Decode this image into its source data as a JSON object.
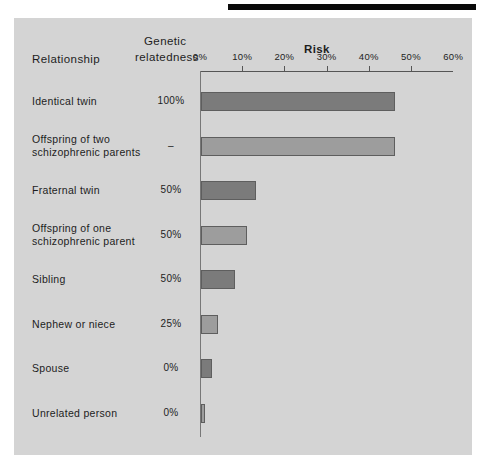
{
  "figure": {
    "headers": {
      "relationship": "Relationship",
      "genetic_line1": "Genetic",
      "genetic_line2": "relatedness",
      "risk": "Risk"
    }
  },
  "colors": {
    "panel_background": "#d4d4d4",
    "bar_dark": "#7b7b7b",
    "bar_light": "#9d9d9d",
    "bar_border": "#5e5e5e",
    "axis": "#555555",
    "text": "#1d1d1d",
    "top_rule": "#0a0a0a"
  },
  "chart_data": {
    "type": "bar",
    "orientation": "horizontal",
    "title": "Risk",
    "xlabel": "Risk",
    "ylabel": "Relationship",
    "xlim": [
      0,
      60
    ],
    "xticks": [
      0,
      10,
      20,
      30,
      40,
      50,
      60
    ],
    "xtick_labels": [
      "0%",
      "10%",
      "20%",
      "30%",
      "40%",
      "50%",
      "60%"
    ],
    "grid": false,
    "legend": "none",
    "categories": [
      "Identical twin",
      "Offspring of two schizophrenic parents",
      "Fraternal twin",
      "Offspring of one schizophrenic parent",
      "Sibling",
      "Nephew or niece",
      "Spouse",
      "Unrelated person"
    ],
    "values": [
      46,
      46,
      13,
      11,
      8,
      4,
      2.5,
      1
    ],
    "secondary_series": {
      "name": "Genetic relatedness",
      "values": [
        "100%",
        "–",
        "50%",
        "50%",
        "50%",
        "25%",
        "0%",
        "0%"
      ]
    }
  },
  "rows": [
    {
      "label_lines": [
        "Identical twin"
      ],
      "genetic": "100%",
      "risk": 46,
      "shade": "dark"
    },
    {
      "label_lines": [
        "Offspring  of two",
        "schizophrenic parents"
      ],
      "genetic": "–",
      "risk": 46,
      "shade": "light"
    },
    {
      "label_lines": [
        "Fraternal twin"
      ],
      "genetic": "50%",
      "risk": 13,
      "shade": "dark"
    },
    {
      "label_lines": [
        "Offspring  of one",
        "schizophrenic parent"
      ],
      "genetic": "50%",
      "risk": 11,
      "shade": "light"
    },
    {
      "label_lines": [
        "Sibling"
      ],
      "genetic": "50%",
      "risk": 8,
      "shade": "dark"
    },
    {
      "label_lines": [
        "Nephew or niece"
      ],
      "genetic": "25%",
      "risk": 4,
      "shade": "light"
    },
    {
      "label_lines": [
        "Spouse"
      ],
      "genetic": "0%",
      "risk": 2.5,
      "shade": "dark"
    },
    {
      "label_lines": [
        "Unrelated person"
      ],
      "genetic": "0%",
      "risk": 1,
      "shade": "light"
    }
  ]
}
